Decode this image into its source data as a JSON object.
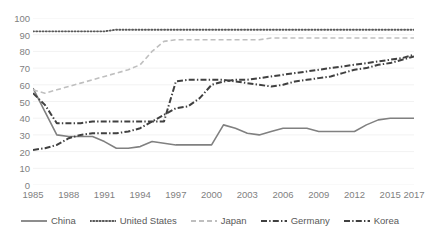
{
  "chart_data": {
    "type": "line",
    "title": "",
    "subtitle": "",
    "xlabel": "",
    "ylabel": "",
    "xlim": [
      1985,
      2017
    ],
    "ylim": [
      0,
      100
    ],
    "grid": true,
    "grid_axis": "y",
    "legend_position": "bottom",
    "x": [
      1985,
      1986,
      1987,
      1988,
      1989,
      1990,
      1991,
      1992,
      1993,
      1994,
      1995,
      1996,
      1997,
      1998,
      1999,
      2000,
      2001,
      2002,
      2003,
      2004,
      2005,
      2006,
      2007,
      2008,
      2009,
      2010,
      2011,
      2012,
      2013,
      2014,
      2015,
      2016,
      2017
    ],
    "y_ticks": [
      0,
      10,
      20,
      30,
      40,
      50,
      60,
      70,
      80,
      90,
      100
    ],
    "x_ticks": [
      1985,
      1988,
      1991,
      1994,
      1997,
      2000,
      2003,
      2006,
      2009,
      2012,
      2015,
      2017
    ],
    "x_tick_labels": [
      "1985",
      "1988",
      "1991",
      "1994",
      "1997",
      "2000",
      "2003",
      "2006",
      "2009",
      "2012",
      "2015",
      "2017"
    ],
    "y_tick_labels": [
      "0",
      "10",
      "20",
      "30",
      "40",
      "50",
      "60",
      "70",
      "80",
      "90",
      "100"
    ],
    "series": [
      {
        "name": "China",
        "color": "#808080",
        "style": "solid",
        "values": [
          58,
          44,
          30,
          29,
          29,
          29,
          26,
          22,
          22,
          23,
          26,
          25,
          24,
          24,
          24,
          24,
          36,
          34,
          31,
          30,
          32,
          34,
          34,
          34,
          32,
          32,
          32,
          32,
          36,
          39,
          40,
          40,
          40
        ]
      },
      {
        "name": "United States",
        "color": "#595959",
        "style": "dotted",
        "values": [
          92,
          92,
          92,
          92,
          92,
          92,
          92,
          93,
          93,
          93,
          93,
          93,
          93,
          93,
          93,
          93,
          93,
          93,
          93,
          93,
          93,
          93,
          93,
          93,
          93,
          93,
          93,
          93,
          93,
          93,
          93,
          93,
          93
        ]
      },
      {
        "name": "Japan",
        "color": "#bfbfbf",
        "style": "dashed",
        "values": [
          57,
          55,
          57,
          59,
          61,
          63,
          65,
          67,
          69,
          72,
          80,
          86,
          87,
          87,
          87,
          87,
          87,
          87,
          87,
          87,
          88,
          88,
          88,
          88,
          88,
          88,
          88,
          88,
          88,
          88,
          88,
          88,
          88
        ]
      },
      {
        "name": "Germany",
        "color": "#404040",
        "style": "dashdot",
        "values": [
          55,
          48,
          37,
          37,
          37,
          38,
          38,
          38,
          38,
          38,
          38,
          38,
          62,
          63,
          63,
          63,
          63,
          62,
          61,
          60,
          59,
          60,
          62,
          63,
          64,
          65,
          67,
          69,
          70,
          72,
          73,
          75,
          77
        ]
      },
      {
        "name": "Korea",
        "color": "#404040",
        "style": "dashdot",
        "values": [
          21,
          22,
          24,
          28,
          30,
          31,
          31,
          31,
          32,
          34,
          38,
          42,
          46,
          47,
          52,
          60,
          62,
          63,
          63,
          64,
          65,
          66,
          67,
          68,
          69,
          70,
          71,
          72,
          73,
          74,
          75,
          76,
          78
        ]
      }
    ]
  },
  "legend": {
    "items": [
      {
        "label": "China",
        "style": "solid",
        "color": "#808080"
      },
      {
        "label": "United States",
        "style": "dotted",
        "color": "#595959"
      },
      {
        "label": "Japan",
        "style": "dashed",
        "color": "#bfbfbf"
      },
      {
        "label": "Germany",
        "style": "dashdot",
        "color": "#404040"
      },
      {
        "label": "Korea",
        "style": "dashdot",
        "color": "#404040"
      }
    ]
  },
  "axis": {
    "grid_color": "#f2f2f2",
    "tick_label_color": "#7f7f7f"
  }
}
